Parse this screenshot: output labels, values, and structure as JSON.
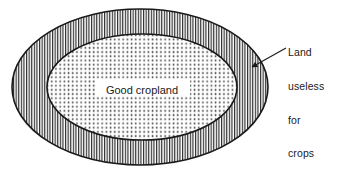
{
  "figure": {
    "type": "venn-nested-ellipse-diagram",
    "background_color": "#ffffff",
    "line_color": "#1a1a1a",
    "text_color": "#1a1a1a"
  },
  "regions": {
    "outer": {
      "label": "Land useless for crops",
      "fill_pattern": "vertical-line-hatch",
      "pattern_color": "#2b2b2b",
      "center": [
        140,
        87
      ],
      "rx": 128,
      "ry": 78
    },
    "inner": {
      "label": "Good cropland",
      "fill_pattern": "dot-stipple",
      "pattern_color": "#555555",
      "center": [
        142,
        87
      ],
      "rx": 95,
      "ry": 53
    }
  },
  "inner_label": {
    "text": "Good cropland",
    "x": 142,
    "y": 91,
    "font_size": 11
  },
  "callout": {
    "lines": [
      "Land",
      "useless",
      "for",
      "crops"
    ],
    "line1": "Land",
    "line2": "useless",
    "line3": "for",
    "line4": "crops",
    "leader_from": [
      286,
      48
    ],
    "leader_to": [
      250,
      68
    ],
    "arrowhead": "filled-triangle"
  }
}
